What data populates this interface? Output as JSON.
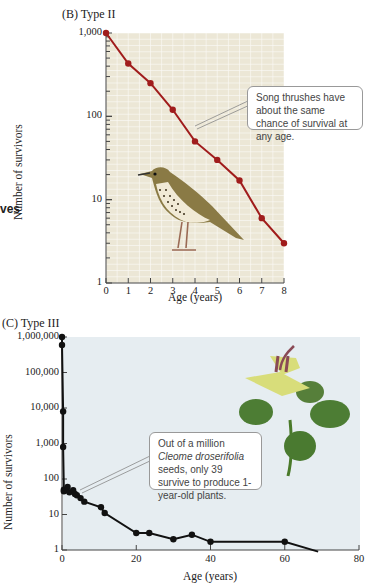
{
  "side_fragment": "ves",
  "chart_data": [
    {
      "type": "line",
      "panel": "(B)",
      "title": "Type II",
      "xlabel": "Age (years)",
      "ylabel": "Number of survivors",
      "yscale": "log",
      "xlim": [
        0,
        8
      ],
      "ylim": [
        1,
        1000
      ],
      "x_ticks": [
        "0",
        "1",
        "2",
        "3",
        "4",
        "5",
        "6",
        "7",
        "8"
      ],
      "y_ticks": [
        "1",
        "10",
        "100",
        "1,000"
      ],
      "grid": true,
      "series": [
        {
          "name": "Song thrush",
          "color": "#a01c1c",
          "x": [
            0,
            1,
            2,
            3,
            4,
            5,
            6,
            7,
            8
          ],
          "y": [
            1000,
            430,
            250,
            120,
            50,
            30,
            17,
            6,
            3
          ]
        }
      ],
      "annotation": "Song thrushes have about the same chance of survival at any age.",
      "illustration": "song thrush"
    },
    {
      "type": "line",
      "panel": "(C)",
      "title": "Type III",
      "xlabel": "Age (years)",
      "ylabel": "Number of survivors",
      "yscale": "log",
      "xlim": [
        0,
        80
      ],
      "ylim": [
        1,
        1000000
      ],
      "x_ticks": [
        "0",
        "20",
        "40",
        "60",
        "80"
      ],
      "y_ticks": [
        "1",
        "10",
        "100",
        "1,000",
        "10,000",
        "100,000",
        "1,000,000"
      ],
      "grid": false,
      "series": [
        {
          "name": "Cleome droserifolia",
          "color": "#111111",
          "x": [
            0,
            0,
            0.3,
            0.3,
            0.5,
            0.5,
            1,
            1.5,
            2,
            3,
            3.5,
            4,
            5,
            6,
            10.5,
            11.5,
            20,
            23.5,
            30,
            35,
            40,
            60,
            69
          ],
          "y": [
            1000000,
            600000,
            8000,
            800,
            50,
            45,
            48,
            60,
            42,
            48,
            38,
            35,
            29,
            23,
            16,
            11,
            3,
            3,
            2,
            2.7,
            1.7,
            1.7,
            0.9
          ]
        }
      ],
      "annotation_parts": [
        "Out of a million ",
        "Cleome droserifolia",
        " seeds, only 39 survive to produce 1-year-old plants."
      ],
      "annotation": "Out of a million Cleome droserifolia seeds, only 39 survive to produce 1-year-old plants.",
      "illustration": "Cleome droserifolia plant"
    }
  ],
  "labels": {
    "b_panel": "(B)  Type II",
    "c_panel": "(C)  Type III",
    "xlabel": "Age (years)",
    "ylabel": "Number of survivors",
    "b_callout": "Song thrushes have about the same chance of survival at any age.",
    "c_callout_1": "Out of a million ",
    "c_callout_italic": "Cleome droserifolia",
    "c_callout_2": " seeds, only 39 survive to produce 1-year-old plants."
  },
  "b_xticks": [
    "0",
    "1",
    "2",
    "3",
    "4",
    "5",
    "6",
    "7",
    "8"
  ],
  "b_yticks": [
    "1",
    "10",
    "100",
    "1,000"
  ],
  "c_xticks": [
    "0",
    "20",
    "40",
    "60",
    "80"
  ],
  "c_yticks": [
    "1",
    "10",
    "100",
    "1,000",
    "10,000",
    "100,000",
    "1,000,000"
  ]
}
